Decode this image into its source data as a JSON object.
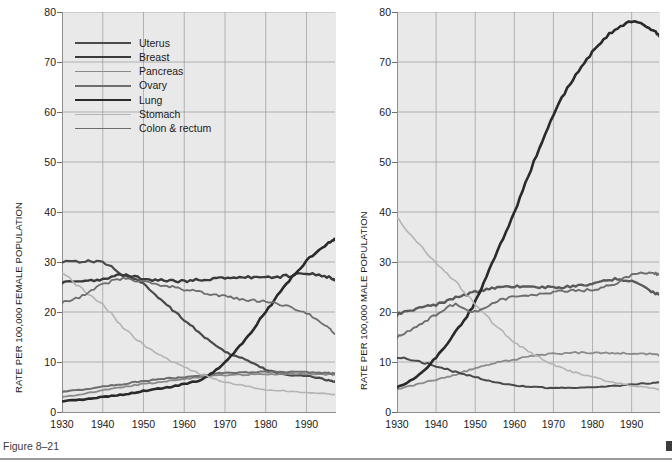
{
  "figure": {
    "caption": "Figure 8–21",
    "background": "#ffffff",
    "plot_background": "#e9e9e9",
    "grid_color": "#9a9a9a",
    "axis_color": "#8d8d8d"
  },
  "chart_data": [
    {
      "type": "line",
      "panel": "left",
      "title": "",
      "xlabel": "",
      "ylabel": "RATE PER 100,000 FEMALE POPULATION",
      "xlim": [
        1930,
        1997
      ],
      "ylim": [
        0,
        80
      ],
      "yticks": [
        0,
        10,
        20,
        30,
        40,
        50,
        60,
        70,
        80
      ],
      "xticks": [
        1930,
        1940,
        1950,
        1960,
        1970,
        1980,
        1990
      ],
      "grid": true,
      "legend_position": "upper-left",
      "x": [
        1930,
        1935,
        1940,
        1945,
        1950,
        1955,
        1960,
        1965,
        1970,
        1975,
        1980,
        1985,
        1990,
        1995,
        1997
      ],
      "series": [
        {
          "name": "Uterus",
          "color": "#4a4a4a",
          "values": [
            30.2,
            30.1,
            29.9,
            27.5,
            25.5,
            22.0,
            18.5,
            15.0,
            12.0,
            10.5,
            8.5,
            7.5,
            7.2,
            6.4,
            6.0
          ]
        },
        {
          "name": "Breast",
          "color": "#3a3a3a",
          "values": [
            26.0,
            26.3,
            26.5,
            27.4,
            26.6,
            26.3,
            26.2,
            26.5,
            26.8,
            27.0,
            26.9,
            27.2,
            27.6,
            27.0,
            26.5
          ]
        },
        {
          "name": "Pancreas",
          "color": "#8a8a8a",
          "values": [
            3.0,
            3.6,
            4.3,
            5.0,
            5.6,
            6.1,
            6.6,
            7.0,
            7.4,
            7.5,
            7.6,
            7.6,
            7.6,
            7.5,
            7.5
          ]
        },
        {
          "name": "Ovary",
          "color": "#6e6e6e",
          "values": [
            4.0,
            4.5,
            5.1,
            5.6,
            6.2,
            6.6,
            7.0,
            7.4,
            7.8,
            7.9,
            8.0,
            8.0,
            7.9,
            7.8,
            7.7
          ]
        },
        {
          "name": "Lung",
          "color": "#2a2a2a",
          "values": [
            2.2,
            2.5,
            3.0,
            3.5,
            4.2,
            4.8,
            5.6,
            6.8,
            10.0,
            14.5,
            20.0,
            25.5,
            30.2,
            33.5,
            34.5
          ]
        },
        {
          "name": "Stomach",
          "color": "#b4b4b4",
          "values": [
            28.0,
            24.5,
            21.5,
            17.0,
            13.5,
            11.0,
            9.0,
            7.3,
            6.0,
            5.2,
            4.5,
            4.2,
            3.9,
            3.6,
            3.5
          ]
        },
        {
          "name": "Colon & rectum",
          "color": "#6e6e6e",
          "values": [
            22.0,
            23.2,
            25.5,
            26.6,
            26.0,
            25.3,
            24.5,
            23.8,
            23.1,
            22.5,
            22.0,
            21.2,
            19.8,
            17.0,
            15.6
          ]
        }
      ]
    },
    {
      "type": "line",
      "panel": "right",
      "title": "",
      "xlabel": "",
      "ylabel": "RATE PER 100,000 MALE POPULATION",
      "xlim": [
        1930,
        1997
      ],
      "ylim": [
        0,
        80
      ],
      "yticks": [
        0,
        10,
        20,
        30,
        40,
        50,
        60,
        70,
        80
      ],
      "xticks": [
        1930,
        1940,
        1950,
        1960,
        1970,
        1980,
        1990
      ],
      "grid": true,
      "legend_position": "upper-left",
      "x": [
        1930,
        1935,
        1940,
        1945,
        1950,
        1955,
        1960,
        1965,
        1970,
        1975,
        1980,
        1985,
        1990,
        1995,
        1997
      ],
      "series": [
        {
          "name": "Pancreas",
          "color": "#8a8a8a",
          "values": [
            4.5,
            5.5,
            6.5,
            7.5,
            8.8,
            9.8,
            10.5,
            11.2,
            11.6,
            11.8,
            11.9,
            11.8,
            11.7,
            11.5,
            11.4
          ]
        },
        {
          "name": "Prostate",
          "color": "#5a5a5a",
          "values": [
            19.5,
            20.6,
            21.5,
            22.8,
            24.0,
            24.8,
            25.2,
            25.0,
            24.9,
            25.2,
            25.5,
            26.5,
            26.0,
            24.2,
            23.5
          ]
        },
        {
          "name": "Liver",
          "color": "#4a4a4a",
          "values": [
            11.0,
            10.2,
            9.2,
            8.0,
            7.0,
            6.0,
            5.3,
            5.0,
            4.8,
            4.8,
            5.0,
            5.2,
            5.5,
            5.8,
            5.9
          ]
        },
        {
          "name": "Lung",
          "color": "#2a2a2a",
          "values": [
            5.0,
            7.0,
            11.0,
            16.0,
            22.0,
            31.0,
            40.0,
            50.0,
            59.5,
            66.5,
            72.0,
            76.0,
            78.0,
            76.5,
            75.2
          ]
        },
        {
          "name": "Stomach",
          "color": "#b4b4b4",
          "values": [
            39.0,
            34.0,
            30.0,
            26.0,
            21.5,
            17.5,
            14.0,
            11.5,
            9.5,
            8.0,
            7.0,
            6.0,
            5.3,
            4.8,
            4.5
          ]
        },
        {
          "name": "Colon & rectum",
          "color": "#6e6e6e",
          "values": [
            15.0,
            17.0,
            19.5,
            21.5,
            20.0,
            22.0,
            23.0,
            23.5,
            24.0,
            24.3,
            24.5,
            25.5,
            27.3,
            27.8,
            27.5
          ]
        }
      ]
    }
  ],
  "left_panel": {
    "ylabel": "RATE PER 100,000 FEMALE POPULATION",
    "yticks": [
      "80",
      "70",
      "60",
      "50",
      "40",
      "30",
      "20",
      "10",
      "0"
    ],
    "xticks": [
      "1930",
      "1940",
      "1950",
      "1960",
      "1970",
      "1980",
      "1990"
    ],
    "legend": [
      {
        "label": "Uterus",
        "color": "#4a4a4a",
        "width": 2.2
      },
      {
        "label": "Breast",
        "color": "#3a3a3a",
        "width": 2.4
      },
      {
        "label": "Pancreas",
        "color": "#8a8a8a",
        "width": 1.8
      },
      {
        "label": "Ovary",
        "color": "#6e6e6e",
        "width": 2.0
      },
      {
        "label": "Lung",
        "color": "#2a2a2a",
        "width": 2.6
      },
      {
        "label": "Stomach",
        "color": "#b4b4b4",
        "width": 1.6
      },
      {
        "label": "Colon & rectum",
        "color": "#6e6e6e",
        "width": 1.8
      }
    ]
  },
  "right_panel": {
    "ylabel": "RATE PER 100,000 MALE POPULATION",
    "yticks": [
      "80",
      "70",
      "60",
      "50",
      "40",
      "30",
      "20",
      "10",
      "0"
    ],
    "xticks": [
      "1930",
      "1940",
      "1950",
      "1960",
      "1970",
      "1980",
      "1990"
    ],
    "legend": [
      {
        "label": "Pancreas",
        "color": "#8a8a8a",
        "width": 1.8
      },
      {
        "label": "Prostate",
        "color": "#5a5a5a",
        "width": 2.4
      },
      {
        "label": "Liver",
        "color": "#4a4a4a",
        "width": 2.0
      },
      {
        "label": "Lung",
        "color": "#2a2a2a",
        "width": 2.6
      },
      {
        "label": "Stomach",
        "color": "#b4b4b4",
        "width": 1.6
      },
      {
        "label": "Colon & rectum",
        "color": "#6e6e6e",
        "width": 1.9
      }
    ]
  }
}
